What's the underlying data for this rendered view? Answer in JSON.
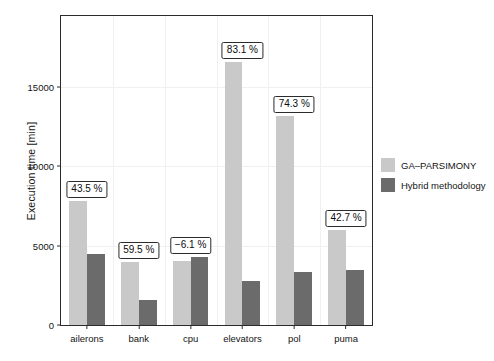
{
  "chart_data": {
    "type": "bar",
    "title": "",
    "subtitle": "",
    "xlabel": "",
    "ylabel": "Execution time [min]",
    "categories": [
      "ailerons",
      "bank",
      "cpu",
      "elevators",
      "pol",
      "puma"
    ],
    "series": [
      {
        "name": "GA-PARSIMONY",
        "color": "#c9c9c9",
        "values": [
          7810,
          3940,
          4000,
          16560,
          13130,
          6000
        ]
      },
      {
        "name": "Hybrid methodology",
        "color": "#6b6b6b",
        "values": [
          4440,
          1560,
          4250,
          2750,
          3310,
          3440
        ]
      }
    ],
    "annotations": [
      {
        "category": "ailerons",
        "text": "43.5 %",
        "value": 43.5
      },
      {
        "category": "bank",
        "text": "59.5 %",
        "value": 59.5
      },
      {
        "category": "cpu",
        "text": "−6.1 %",
        "value": -6.1
      },
      {
        "category": "elevators",
        "text": "83.1 %",
        "value": 83.1
      },
      {
        "category": "pol",
        "text": "74.3 %",
        "value": 74.3
      },
      {
        "category": "puma",
        "text": "42.7 %",
        "value": 42.7
      }
    ],
    "yticks": [
      0,
      5000,
      10000,
      15000
    ],
    "ytick_labels": [
      "0",
      "5000",
      "10000",
      "15000"
    ],
    "ylim": [
      0,
      19440
    ],
    "xlim_note": "categorical",
    "grid": "light horizontal and vertical gridlines",
    "legend_position": "right"
  },
  "legend": {
    "entries": [
      {
        "label": "GA–PARSIMONY",
        "color": "#c9c9c9"
      },
      {
        "label": "Hybrid methodology",
        "color": "#6b6b6b"
      }
    ]
  },
  "axis": {
    "y_title": "Execution time [min]"
  },
  "colors": {
    "series_light": "#c9c9c9",
    "series_dark": "#6b6b6b",
    "frame": "#2b2b2b",
    "grid": "#f0f0f0",
    "background": "#ffffff",
    "text": "#141414"
  }
}
